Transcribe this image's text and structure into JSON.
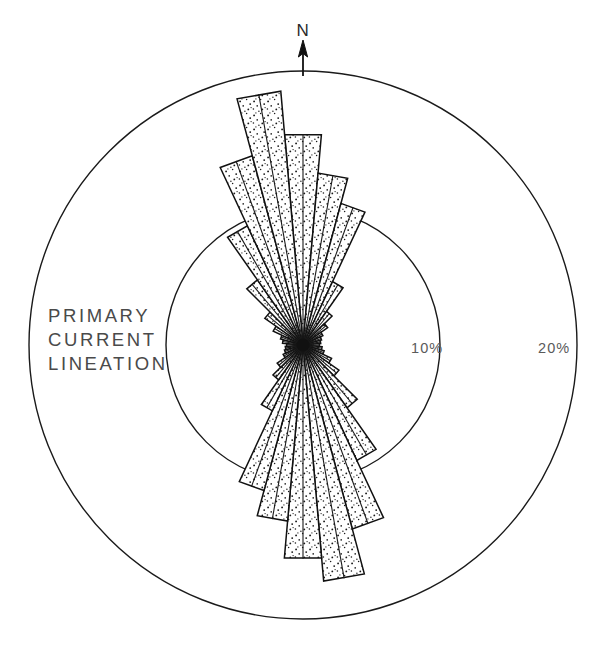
{
  "figure": {
    "title_lines": [
      "PRIMARY",
      "CURRENT",
      "LINEATION"
    ],
    "north_label": "N",
    "ring_labels": [
      {
        "text": "10%",
        "value": 10
      },
      {
        "text": "20%",
        "value": 20
      }
    ],
    "stroke_color": "#111111",
    "fill_color": "#ffffff",
    "stipple_color": "#1a1a1a",
    "background": "#ffffff"
  },
  "chart_data": {
    "type": "bar",
    "subtype": "rose-diagram",
    "title": "PRIMARY CURRENT LINEATION",
    "xlabel": "Azimuth (degrees from North)",
    "ylabel": "Percent of measurements",
    "units": "%",
    "sector_width_deg": 10,
    "n_sectors": 36,
    "grid": true,
    "legend": false,
    "rlim": [
      0,
      20
    ],
    "rings": [
      10,
      20
    ],
    "ring_tick_labels": [
      "10%",
      "20%"
    ],
    "orientation": "north-up-clockwise",
    "categories": [
      "0",
      "10",
      "20",
      "30",
      "40",
      "50",
      "60",
      "70",
      "80",
      "90",
      "100",
      "110",
      "120",
      "130",
      "140",
      "150",
      "160",
      "170",
      "180",
      "190",
      "200",
      "210",
      "220",
      "230",
      "240",
      "250",
      "260",
      "270",
      "280",
      "290",
      "300",
      "310",
      "320",
      "330",
      "340",
      "350"
    ],
    "values": [
      15.4,
      12.6,
      10.7,
      5.1,
      3.0,
      2.2,
      1.6,
      1.4,
      1.3,
      1.2,
      1.4,
      1.6,
      2.3,
      3.2,
      5.6,
      9.3,
      13.9,
      17.3,
      15.6,
      12.9,
      11.0,
      5.3,
      3.1,
      2.3,
      1.6,
      1.4,
      1.3,
      1.2,
      1.5,
      1.7,
      2.4,
      3.4,
      5.8,
      9.6,
      14.3,
      18.6
    ]
  }
}
